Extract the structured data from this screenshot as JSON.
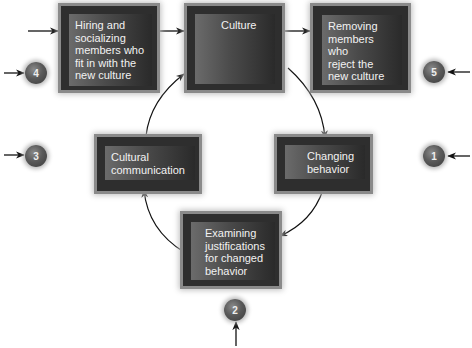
{
  "diagram": {
    "type": "cycle-process",
    "boxes": [
      {
        "id": "hiring",
        "label": "Hiring and\nsocializing\nmembers who\nfit in with the\nnew culture"
      },
      {
        "id": "culture",
        "label": "Culture"
      },
      {
        "id": "removing",
        "label": "Removing\nmembers who\nreject the\nnew culture"
      },
      {
        "id": "changing",
        "label": "Changing\nbehavior"
      },
      {
        "id": "examining",
        "label": "Examining\njustifications\nfor changed\nbehavior"
      },
      {
        "id": "communication",
        "label": "Cultural\ncommunication"
      }
    ],
    "steps": [
      {
        "number": "1",
        "target": "changing"
      },
      {
        "number": "2",
        "target": "examining"
      },
      {
        "number": "3",
        "target": "communication"
      },
      {
        "number": "4",
        "target": "hiring"
      },
      {
        "number": "5",
        "target": "removing"
      }
    ],
    "flows": [
      {
        "from": "hiring",
        "to": "culture"
      },
      {
        "from": "culture",
        "to": "removing"
      },
      {
        "from": "culture",
        "to": "changing"
      },
      {
        "from": "changing",
        "to": "examining"
      },
      {
        "from": "examining",
        "to": "communication"
      },
      {
        "from": "communication",
        "to": "culture"
      }
    ],
    "colors": {
      "box_outer": "#2e2e2e",
      "box_border": "#8a8a8a",
      "text": "#f2f2f2",
      "badge": "#5a5a5a",
      "arrow": "#111111"
    }
  }
}
